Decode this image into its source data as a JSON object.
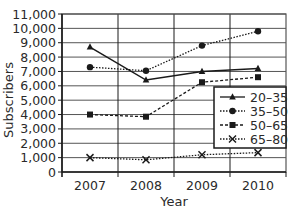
{
  "chart_data": {
    "type": "line",
    "title": "",
    "xlabel": "Year",
    "ylabel": "Subscribers",
    "categories": [
      "2007",
      "2008",
      "2009",
      "2010"
    ],
    "ylim": [
      0,
      11000
    ],
    "yticks": [
      0,
      1000,
      2000,
      3000,
      4000,
      5000,
      6000,
      7000,
      8000,
      9000,
      10000,
      11000
    ],
    "ytick_labels": [
      "0",
      "1,000",
      "2,000",
      "3,000",
      "4,000",
      "5,000",
      "6,000",
      "7,000",
      "8,000",
      "9,000",
      "10,000",
      "11,000"
    ],
    "grid": true,
    "legend_position": "lower right inside",
    "series": [
      {
        "name": "20–35",
        "marker": "triangle",
        "line": "solid",
        "values": [
          8700,
          6400,
          7000,
          7200
        ]
      },
      {
        "name": "35–50",
        "marker": "circle",
        "line": "dotted",
        "values": [
          7300,
          7050,
          8800,
          9800
        ]
      },
      {
        "name": "50–65",
        "marker": "square",
        "line": "dashed",
        "values": [
          4000,
          3850,
          6250,
          6600
        ]
      },
      {
        "name": "65–80",
        "marker": "x",
        "line": "dotted",
        "values": [
          1000,
          850,
          1200,
          1350
        ]
      }
    ]
  },
  "colors": {
    "line": "#1a1a1a",
    "grid": "#555555",
    "text": "#2a2a2a"
  }
}
